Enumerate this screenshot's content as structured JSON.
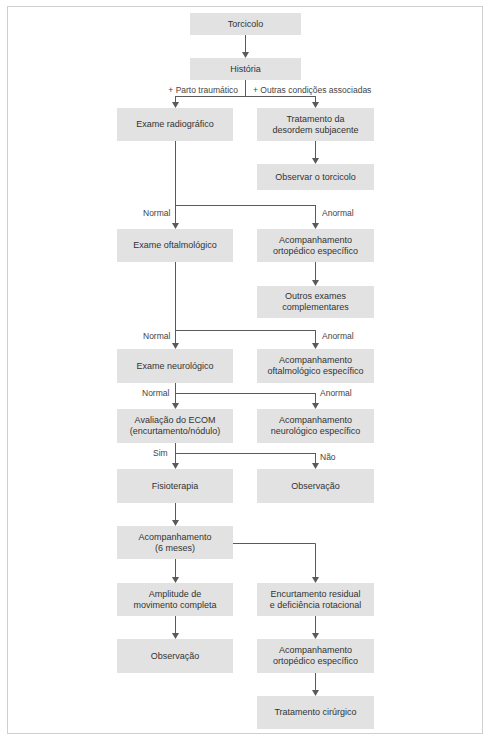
{
  "diagram": {
    "type": "flowchart",
    "language": "pt",
    "nodes": {
      "torcicolo": "Torcicolo",
      "historia": "História",
      "exame_radiografico": "Exame radiográfico",
      "tratamento_desordem": "Tratamento da\ndesordem subjacente",
      "observar_torcicolo": "Observar o torcicolo",
      "exame_oftalmologico": "Exame oftalmológico",
      "acomp_ortopedico_1": "Acompanhamento\nortopédico específico",
      "outros_exames": "Outros exames\ncomplementares",
      "exame_neurologico": "Exame neurológico",
      "acomp_oftalmologico": "Acompanhamento\noftalmológico específico",
      "avaliacao_ecom": "Avaliação do ECOM\n(encurtamento/nódulo)",
      "acomp_neurologico": "Acompanhamento\nneurológico específico",
      "fisioterapia": "Fisioterapia",
      "observacao_1": "Observação",
      "acomp_6meses": "Acompanhamento\n(6 meses)",
      "amplitude": "Amplitude de\nmovimento completa",
      "encurtamento": "Encurtamento residual\ne deficiência rotacional",
      "observacao_2": "Observação",
      "acomp_ortopedico_2": "Acompanhamento\nortopédico específico",
      "tratamento_cirurgico": "Tratamento cirúrgico"
    },
    "labels": {
      "parto": "+ Parto traumático",
      "outras": "+ Outras condições associadas",
      "normal_1": "Normal",
      "anormal_1": "Anormal",
      "normal_2": "Normal",
      "anormal_2": "Anormal",
      "normal_3": "Normal",
      "anormal_3": "Anormal",
      "sim": "Sim",
      "nao": "Não"
    },
    "edges": [
      [
        "torcicolo",
        "historia",
        ""
      ],
      [
        "historia",
        "exame_radiografico",
        "+ Parto traumático"
      ],
      [
        "historia",
        "tratamento_desordem",
        "+ Outras condições associadas"
      ],
      [
        "tratamento_desordem",
        "observar_torcicolo",
        ""
      ],
      [
        "exame_radiografico",
        "exame_oftalmologico",
        "Normal"
      ],
      [
        "exame_radiografico",
        "acomp_ortopedico_1",
        "Anormal"
      ],
      [
        "acomp_ortopedico_1",
        "outros_exames",
        ""
      ],
      [
        "exame_oftalmologico",
        "exame_neurologico",
        "Normal"
      ],
      [
        "exame_oftalmologico",
        "acomp_oftalmologico",
        "Anormal"
      ],
      [
        "exame_neurologico",
        "avaliacao_ecom",
        "Normal"
      ],
      [
        "exame_neurologico",
        "acomp_neurologico",
        "Anormal"
      ],
      [
        "avaliacao_ecom",
        "fisioterapia",
        "Sim"
      ],
      [
        "avaliacao_ecom",
        "observacao_1",
        "Não"
      ],
      [
        "fisioterapia",
        "acomp_6meses",
        ""
      ],
      [
        "acomp_6meses",
        "amplitude",
        ""
      ],
      [
        "acomp_6meses",
        "encurtamento",
        ""
      ],
      [
        "amplitude",
        "observacao_2",
        ""
      ],
      [
        "encurtamento",
        "acomp_ortopedico_2",
        ""
      ],
      [
        "acomp_ortopedico_2",
        "tratamento_cirurgico",
        ""
      ]
    ],
    "colors": {
      "box_fill": "#e2e2e2",
      "line": "#5a5a5a",
      "text": "#333333",
      "frame": "#cfcfcf"
    }
  }
}
